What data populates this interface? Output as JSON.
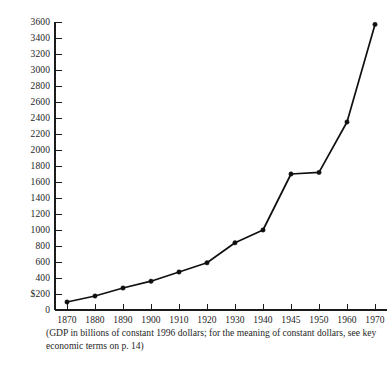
{
  "chart_data": {
    "type": "line",
    "title": "",
    "subtitle": "",
    "caption": "(GDP in billions of constant 1996 dollars; for the meaning of constant dollars, see key economic terms on p. 14)",
    "xlabel": "",
    "ylabel": "",
    "x": [
      "1870",
      "1880",
      "1890",
      "1900",
      "1910",
      "1920",
      "1930",
      "1940",
      "1945",
      "1950",
      "1960",
      "1970"
    ],
    "categories": [
      "1870",
      "1880",
      "1890",
      "1900",
      "1910",
      "1920",
      "1930",
      "1940",
      "1945",
      "1950",
      "1960",
      "1970"
    ],
    "values": [
      100,
      175,
      275,
      360,
      475,
      590,
      840,
      1000,
      1700,
      1720,
      2350,
      3570
    ],
    "series": [
      {
        "name": "GDP",
        "values": [
          100,
          175,
          275,
          360,
          475,
          590,
          840,
          1000,
          1700,
          1720,
          2350,
          3570
        ]
      }
    ],
    "ylim": [
      0,
      3600
    ],
    "ytick_values": [
      0,
      200,
      400,
      600,
      800,
      1000,
      1200,
      1400,
      1600,
      1800,
      2000,
      2200,
      2400,
      2600,
      2800,
      3000,
      3200,
      3400,
      3600
    ],
    "ytick_labels": [
      "0",
      "$200",
      "400",
      "600",
      "800",
      "1000",
      "1200",
      "1400",
      "1600",
      "1800",
      "2000",
      "2200",
      "2400",
      "2600",
      "2800",
      "3000",
      "3200",
      "3400",
      "3600"
    ],
    "xtick_labels": [
      "1870",
      "1880",
      "1890",
      "1900",
      "1910",
      "1920",
      "1930",
      "1940",
      "1945",
      "1950",
      "1960",
      "1970"
    ],
    "grid": false,
    "legend": null,
    "legend_position": "none",
    "marker": "filled-circle",
    "line_color": "#101010",
    "axis_color": "#1a1a1a",
    "background_color": "#ffffff",
    "annotations": []
  }
}
